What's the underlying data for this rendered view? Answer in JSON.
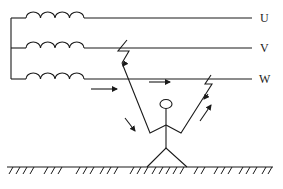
{
  "diagram": {
    "type": "three-phase-electric-shock-diagram",
    "phases": [
      {
        "label": "U",
        "y": 18
      },
      {
        "label": "V",
        "y": 48
      },
      {
        "label": "W",
        "y": 79
      }
    ],
    "colors": {
      "line": "#1a1a1a",
      "background": "#ffffff"
    },
    "icons": {
      "winding": "coil-icon",
      "fault": "lightning-break-icon",
      "current_direction": "arrow-icon",
      "person": "stick-figure-icon",
      "ground": "ground-hatch-icon"
    }
  }
}
